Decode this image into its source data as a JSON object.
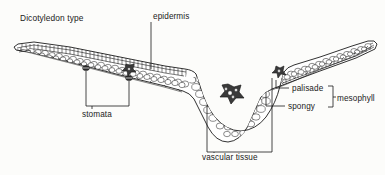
{
  "figure": {
    "kind": "botanical-line-diagram",
    "title": "Dicotyledon type",
    "background_color": "#fcfcfa",
    "ink_color": "#1b1b1b"
  },
  "labels": {
    "title": "Dicotyledon type",
    "epidermis": "epidermis",
    "stomata": "stomata",
    "vascular_tissue": "vascular tissue",
    "palisade": "palisade",
    "spongy": "spongy",
    "mesophyll": "mesophyll"
  },
  "structures": [
    {
      "name": "epidermis",
      "description": "thin outer cell layer on upper and lower leaf surfaces"
    },
    {
      "name": "palisade mesophyll",
      "description": "column-shaped cells packed beneath the upper epidermis"
    },
    {
      "name": "spongy mesophyll",
      "description": "rounded loosely packed cells with air spaces below palisade layer"
    },
    {
      "name": "stomata",
      "description": "pores in the lower epidermis, two marked on the left lamina"
    },
    {
      "name": "vascular tissue",
      "description": "central midrib bundle and a smaller lateral bundle"
    }
  ],
  "leaders": {
    "epidermis": {
      "from_label": "epidermis",
      "points_to": "upper epidermis layer near midrib"
    },
    "stomata": {
      "from_label": "stomata",
      "points_to": "two stomata on lower epidermis of left lamina",
      "count": 2
    },
    "vascular_tissue": {
      "from_label": "vascular tissue",
      "points_to": "midrib bundle and right lamina bundle",
      "count": 2
    },
    "palisade": {
      "from_label": "palisade",
      "points_to": "palisade layer of right lamina"
    },
    "spongy": {
      "from_label": "spongy",
      "points_to": "spongy layer of right lamina"
    },
    "mesophyll": {
      "from_label": "mesophyll",
      "points_to": "bracket grouping palisade and spongy"
    }
  }
}
